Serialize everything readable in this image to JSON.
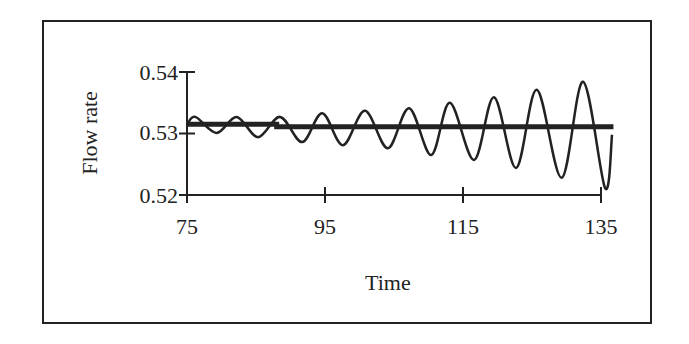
{
  "chart_data": {
    "type": "line",
    "title": "",
    "xlabel": "Time",
    "ylabel": "Flow rate",
    "xlim": [
      75,
      135
    ],
    "ylim": [
      0.52,
      0.54
    ],
    "x_ticks": [
      "75",
      "95",
      "115",
      "135"
    ],
    "y_ticks": [
      "0.52",
      "0.53",
      "0.54"
    ],
    "grid": false,
    "legend": null,
    "series": [
      {
        "name": "Flow rate (oscillating)",
        "style": "thin line",
        "points": [
          [
            75.0,
            0.5314
          ],
          [
            76.2,
            0.5327
          ],
          [
            79.3,
            0.5301
          ],
          [
            82.2,
            0.5327
          ],
          [
            85.3,
            0.5294
          ],
          [
            88.5,
            0.5327
          ],
          [
            91.7,
            0.5286
          ],
          [
            94.6,
            0.5333
          ],
          [
            97.6,
            0.5281
          ],
          [
            100.8,
            0.5337
          ],
          [
            104.1,
            0.5276
          ],
          [
            107.2,
            0.5341
          ],
          [
            110.4,
            0.5265
          ],
          [
            113.1,
            0.535
          ],
          [
            116.6,
            0.5257
          ],
          [
            119.5,
            0.5359
          ],
          [
            122.7,
            0.5244
          ],
          [
            125.7,
            0.5371
          ],
          [
            129.3,
            0.5228
          ],
          [
            132.4,
            0.5384
          ],
          [
            135.6,
            0.5211
          ],
          [
            136.6,
            0.5298
          ]
        ]
      },
      {
        "name": "Steady-state flow rate",
        "style": "thick line",
        "points": [
          [
            75.0,
            0.5315
          ],
          [
            88.0,
            0.5315
          ],
          [
            88.0,
            0.5311
          ],
          [
            136.8,
            0.5311
          ]
        ]
      }
    ]
  },
  "axes": {
    "xlabel": "Time",
    "ylabel": "Flow rate",
    "x_tick_labels": [
      "75",
      "95",
      "115",
      "135"
    ],
    "y_tick_labels": [
      "0.54",
      "0.53",
      "0.52"
    ]
  },
  "colors": {
    "line": "#222222",
    "background": "#ffffff"
  }
}
